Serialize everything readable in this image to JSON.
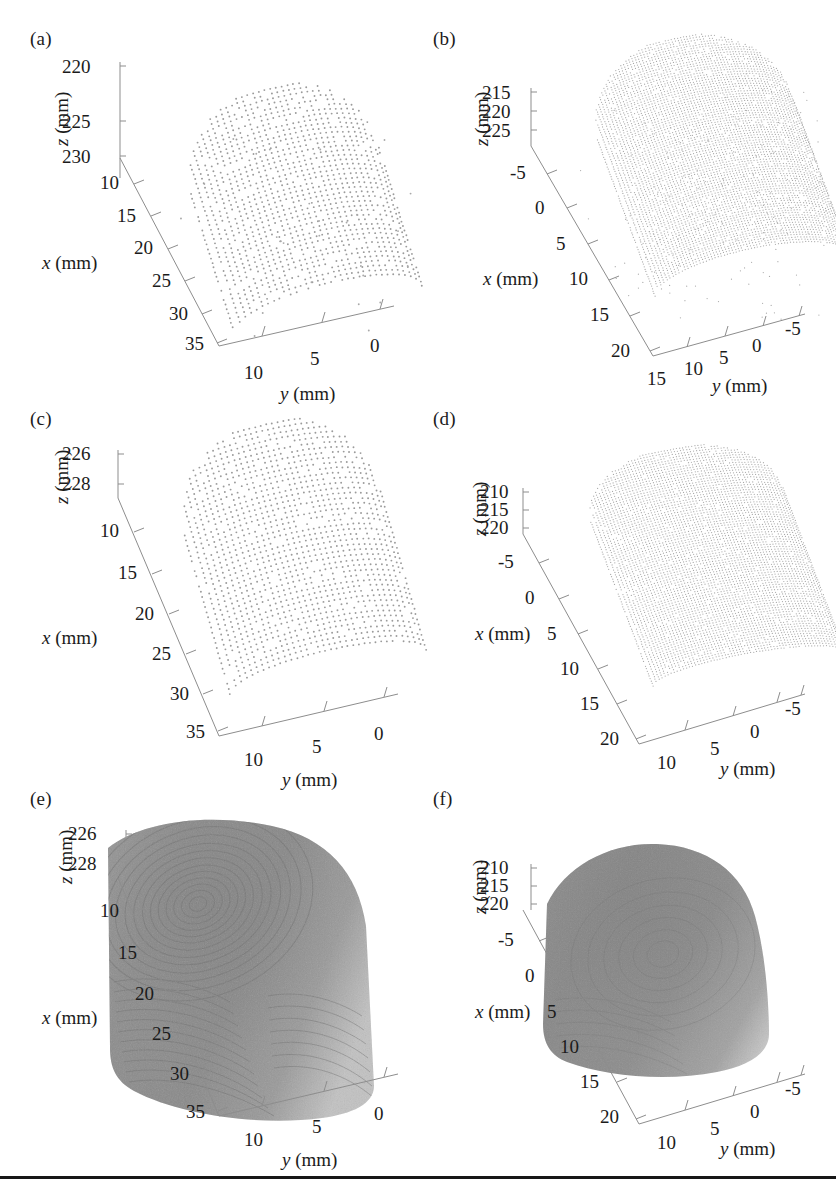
{
  "figure": {
    "panel_labels": [
      "(a)",
      "(b)",
      "(c)",
      "(d)",
      "(e)",
      "(f)"
    ],
    "axis_unit": "(mm)",
    "axis_names": {
      "x": "x",
      "y": "y",
      "z": "z"
    },
    "point_color": "#9b9b9b",
    "axis_color": "#8d8d8d",
    "surface_color": "#8a8a8a",
    "rule_color": "#171717"
  },
  "chart_data": [
    {
      "type": "scatter",
      "panel": "(a)",
      "title": "",
      "render": "point-cloud",
      "xlabel": "x (mm)",
      "ylabel": "y (mm)",
      "zlabel": "z (mm)",
      "xticks": [
        10,
        15,
        20,
        25,
        30,
        35
      ],
      "yticks": [
        10,
        5,
        0
      ],
      "zticks": [
        220,
        225,
        230
      ],
      "xlim": [
        8,
        37
      ],
      "ylim": [
        12,
        -1
      ],
      "zlim": [
        219,
        231
      ],
      "grid": false,
      "legend": null,
      "n_points_approx": 1100,
      "description": "Sparse 3D point cloud of a fingertip surface, coarse grid spacing"
    },
    {
      "type": "scatter",
      "panel": "(b)",
      "title": "",
      "render": "point-cloud",
      "xlabel": "x (mm)",
      "ylabel": "y (mm)",
      "zlabel": "z (mm)",
      "xticks": [
        -5,
        0,
        5,
        10,
        15,
        20
      ],
      "yticks": [
        15,
        10,
        5,
        0,
        -5
      ],
      "zticks": [
        215,
        220,
        225
      ],
      "xlim": [
        -7,
        22
      ],
      "ylim": [
        17,
        -7
      ],
      "zlim": [
        213,
        227
      ],
      "grid": false,
      "legend": null,
      "n_points_approx": 5200,
      "description": "Dense 3D point cloud of a fingertip surface with scattered outliers below"
    },
    {
      "type": "scatter",
      "panel": "(c)",
      "title": "",
      "render": "point-cloud",
      "xlabel": "x (mm)",
      "ylabel": "y (mm)",
      "zlabel": "z (mm)",
      "xticks": [
        10,
        15,
        20,
        25,
        30,
        35
      ],
      "yticks": [
        10,
        5,
        0
      ],
      "zticks": [
        226,
        228
      ],
      "xlim": [
        8,
        37
      ],
      "ylim": [
        12,
        -1
      ],
      "zlim": [
        225,
        229
      ],
      "grid": false,
      "legend": null,
      "n_points_approx": 1200,
      "description": "Filtered sparse point cloud of the same fingertip, outliers removed"
    },
    {
      "type": "scatter",
      "panel": "(d)",
      "title": "",
      "render": "point-cloud",
      "xlabel": "x (mm)",
      "ylabel": "y (mm)",
      "zlabel": "z (mm)",
      "xticks": [
        -5,
        0,
        5,
        10,
        15,
        20
      ],
      "yticks": [
        10,
        5,
        0,
        -5
      ],
      "zticks": [
        210,
        215,
        220
      ],
      "xlim": [
        -7,
        22
      ],
      "ylim": [
        13,
        -7
      ],
      "zlim": [
        208,
        222
      ],
      "grid": false,
      "legend": null,
      "n_points_approx": 5400,
      "description": "Filtered dense point cloud of the second fingertip, outliers removed"
    },
    {
      "type": "surface",
      "panel": "(e)",
      "title": "",
      "render": "shaded-surface",
      "xlabel": "x (mm)",
      "ylabel": "y (mm)",
      "zlabel": "z (mm)",
      "xticks": [
        10,
        15,
        20,
        25,
        30,
        35
      ],
      "yticks": [
        10,
        5,
        0
      ],
      "zticks": [
        226,
        228
      ],
      "xlim": [
        8,
        37
      ],
      "ylim": [
        12,
        -1
      ],
      "zlim": [
        225,
        229
      ],
      "grid": false,
      "legend": null,
      "description": "Reconstructed shaded 3D surface of the fingertip showing fingerprint ridge detail"
    },
    {
      "type": "surface",
      "panel": "(f)",
      "title": "",
      "render": "shaded-surface",
      "xlabel": "x (mm)",
      "ylabel": "y (mm)",
      "zlabel": "z (mm)",
      "xticks": [
        -5,
        0,
        5,
        10,
        15,
        20
      ],
      "yticks": [
        10,
        5,
        0,
        -5
      ],
      "zticks": [
        210,
        215,
        220
      ],
      "xlim": [
        -7,
        22
      ],
      "ylim": [
        13,
        -7
      ],
      "zlim": [
        208,
        222
      ],
      "grid": false,
      "legend": null,
      "description": "Reconstructed shaded 3D surface of the second fingertip, smooth with faint ridges"
    }
  ],
  "panels": {
    "a": {
      "label": "(a)",
      "z_axis_name": "z (mm)",
      "x_axis_name": "x (mm)",
      "y_axis_name": "y (mm)",
      "z_ticks": [
        "220",
        "225",
        "230"
      ],
      "x_ticks": [
        "10",
        "15",
        "20",
        "25",
        "30",
        "35"
      ],
      "y_ticks": [
        "10",
        "5",
        "0"
      ]
    },
    "b": {
      "label": "(b)",
      "z_axis_name": "z (mm)",
      "x_axis_name": "x (mm)",
      "y_axis_name": "y (mm)",
      "z_ticks": [
        "215",
        "220",
        "225"
      ],
      "x_ticks": [
        "-5",
        "0",
        "5",
        "10",
        "15",
        "20"
      ],
      "y_ticks": [
        "15",
        "10",
        "5",
        "0",
        "-5"
      ]
    },
    "c": {
      "label": "(c)",
      "z_axis_name": "z (mm)",
      "x_axis_name": "x (mm)",
      "y_axis_name": "y (mm)",
      "z_ticks": [
        "226",
        "228"
      ],
      "x_ticks": [
        "10",
        "15",
        "20",
        "25",
        "30",
        "35"
      ],
      "y_ticks": [
        "10",
        "5",
        "0"
      ]
    },
    "d": {
      "label": "(d)",
      "z_axis_name": "z (mm)",
      "x_axis_name": "x (mm)",
      "y_axis_name": "y (mm)",
      "z_ticks": [
        "210",
        "215",
        "220"
      ],
      "x_ticks": [
        "-5",
        "0",
        "5",
        "10",
        "15",
        "20"
      ],
      "y_ticks": [
        "10",
        "5",
        "0",
        "-5"
      ]
    },
    "e": {
      "label": "(e)",
      "z_axis_name": "z (mm)",
      "x_axis_name": "x (mm)",
      "y_axis_name": "y (mm)",
      "z_ticks": [
        "226",
        "228"
      ],
      "x_ticks": [
        "10",
        "15",
        "20",
        "25",
        "30",
        "35"
      ],
      "y_ticks": [
        "10",
        "5",
        "0"
      ]
    },
    "f": {
      "label": "(f)",
      "z_axis_name": "z (mm)",
      "x_axis_name": "x (mm)",
      "y_axis_name": "y (mm)",
      "z_ticks": [
        "210",
        "215",
        "220"
      ],
      "x_ticks": [
        "-5",
        "0",
        "5",
        "10",
        "15",
        "20"
      ],
      "y_ticks": [
        "10",
        "5",
        "0",
        "-5"
      ]
    }
  }
}
